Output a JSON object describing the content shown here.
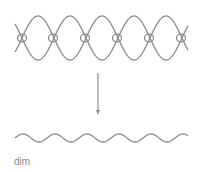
{
  "diagram": {
    "top_label": "",
    "caption": "dim",
    "stroke_color": "#8c8c8c",
    "top_wave": {
      "description": "two antiphase sinusoids with small loops at nodes",
      "x_start": 15,
      "x_end": 188,
      "center_y": 38,
      "amplitude": 22,
      "wavelength": 64,
      "nodes_x": [
        22,
        53,
        85,
        117,
        149,
        181
      ]
    },
    "arrow": {
      "x": 98,
      "y_start": 73,
      "y_end": 115,
      "direction": "down"
    },
    "bottom_wave": {
      "x_start": 15,
      "x_end": 188,
      "center_y": 138,
      "amplitude": 4,
      "wavelength": 32
    }
  }
}
